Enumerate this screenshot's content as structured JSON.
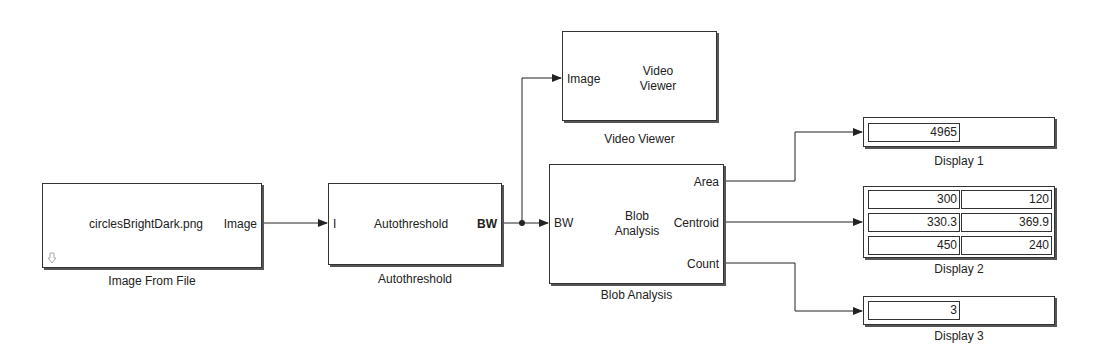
{
  "blocks": {
    "image_from_file": {
      "name": "Image From File",
      "content": "circlesBrightDark.png",
      "out_port": "Image"
    },
    "autothreshold": {
      "name": "Autothreshold",
      "content": "Autothreshold",
      "in_port": "I",
      "out_port": "BW"
    },
    "video_viewer": {
      "name": "Video Viewer",
      "content_line1": "Video",
      "content_line2": "Viewer",
      "in_port": "Image"
    },
    "blob_analysis": {
      "name": "Blob Analysis",
      "content_line1": "Blob",
      "content_line2": "Analysis",
      "in_port": "BW",
      "out_ports": [
        "Area",
        "Centroid",
        "Count"
      ]
    },
    "display1": {
      "name": "Display 1",
      "value": "4965"
    },
    "display2": {
      "name": "Display 2",
      "rows": [
        [
          "300",
          "120"
        ],
        [
          "330.3",
          "369.9"
        ],
        [
          "450",
          "240"
        ]
      ]
    },
    "display3": {
      "name": "Display 3",
      "value": "3"
    }
  },
  "icons": {
    "image_from_file_corner": "download-arrow-icon"
  },
  "colors": {
    "line": "#222222",
    "block_border": "#333333",
    "background": "#ffffff"
  }
}
